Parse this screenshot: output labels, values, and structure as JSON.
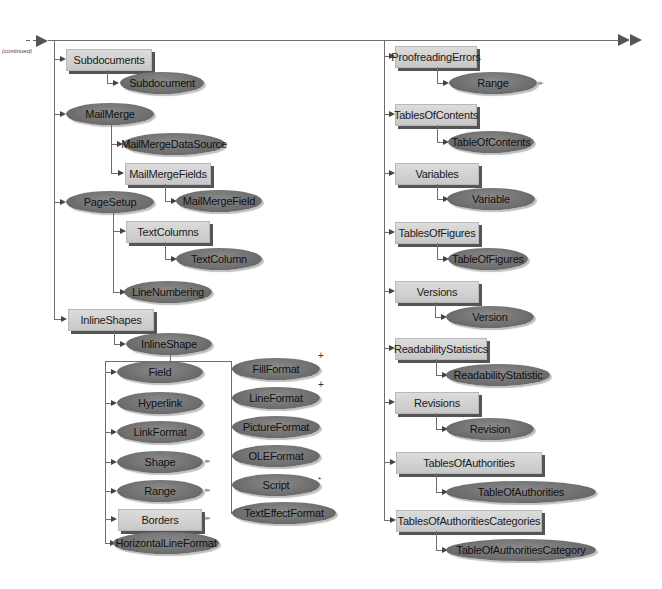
{
  "diagram": {
    "continued_label": "(continued)",
    "left_column": {
      "subdocuments": {
        "label": "Subdocuments",
        "kind": "collection",
        "child": {
          "label": "Subdocument",
          "kind": "object"
        }
      },
      "mailmerge": {
        "label": "MailMerge",
        "kind": "object",
        "children": [
          {
            "label": "MailMergeDataSource",
            "kind": "object"
          },
          {
            "label": "MailMergeFields",
            "kind": "collection",
            "child": {
              "label": "MailMergeField",
              "kind": "object"
            }
          }
        ]
      },
      "pagesetup": {
        "label": "PageSetup",
        "kind": "object",
        "children": [
          {
            "label": "TextColumns",
            "kind": "collection",
            "child": {
              "label": "TextColumn",
              "kind": "object"
            }
          },
          {
            "label": "LineNumbering",
            "kind": "object"
          }
        ]
      },
      "inlineshapes": {
        "label": "InlineShapes",
        "kind": "collection",
        "child": {
          "label": "InlineShape",
          "kind": "object"
        },
        "left_children": [
          {
            "label": "Field",
            "kind": "object",
            "marker": ""
          },
          {
            "label": "Hyperlink",
            "kind": "object",
            "marker": ""
          },
          {
            "label": "LinkFormat",
            "kind": "object",
            "marker": ""
          },
          {
            "label": "Shape",
            "kind": "object",
            "marker": "▸▸"
          },
          {
            "label": "Range",
            "kind": "object",
            "marker": "▸▸"
          },
          {
            "label": "Borders",
            "kind": "collection",
            "marker": "▸▸"
          },
          {
            "label": "HorizontalLineFormat",
            "kind": "object",
            "marker": ""
          }
        ],
        "right_children": [
          {
            "label": "FillFormat",
            "kind": "object",
            "marker": "+"
          },
          {
            "label": "LineFormat",
            "kind": "object",
            "marker": "+"
          },
          {
            "label": "PictureFormat",
            "kind": "object",
            "marker": ""
          },
          {
            "label": "OLEFormat",
            "kind": "object",
            "marker": ""
          },
          {
            "label": "Script",
            "kind": "object",
            "marker": "*"
          },
          {
            "label": "TextEffectFormat",
            "kind": "object",
            "marker": ""
          }
        ]
      }
    },
    "right_column": [
      {
        "label": "ProofreadingErrors",
        "kind": "collection",
        "child": {
          "label": "Range",
          "kind": "object",
          "marker": "▸▸"
        }
      },
      {
        "label": "TablesOfContents",
        "kind": "collection",
        "child": {
          "label": "TableOfContents",
          "kind": "object"
        }
      },
      {
        "label": "Variables",
        "kind": "collection",
        "child": {
          "label": "Variable",
          "kind": "object"
        }
      },
      {
        "label": "TablesOfFigures",
        "kind": "collection",
        "child": {
          "label": "TableOfFigures",
          "kind": "object"
        }
      },
      {
        "label": "Versions",
        "kind": "collection",
        "child": {
          "label": "Version",
          "kind": "object"
        }
      },
      {
        "label": "ReadabilityStatistics",
        "kind": "collection",
        "child": {
          "label": "ReadabilityStatistic",
          "kind": "object"
        }
      },
      {
        "label": "Revisions",
        "kind": "collection",
        "child": {
          "label": "Revision",
          "kind": "object"
        }
      },
      {
        "label": "TablesOfAuthorities",
        "kind": "collection",
        "child": {
          "label": "TableOfAuthorities",
          "kind": "object"
        }
      },
      {
        "label": "TablesOfAuthoritiesCategories",
        "kind": "collection",
        "child": {
          "label": "TableOfAuthoritiesCategory",
          "kind": "object"
        }
      }
    ],
    "colors": {
      "collection_fill": "#d2d2d2",
      "object_fill": "#777777",
      "line": "#6e6e6e",
      "shadow": "#555555"
    }
  }
}
